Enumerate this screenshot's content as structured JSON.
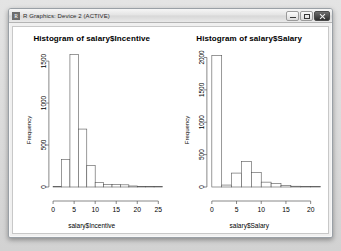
{
  "window": {
    "title": "R Graphics: Device 2 (ACTIVE)",
    "app_icon": "r-logo-icon",
    "controls": {
      "minimize_label": "",
      "maximize_label": "",
      "close_label": ""
    }
  },
  "chart_data": [
    {
      "type": "bar",
      "subtype": "histogram",
      "title": "Histogram of salary$Incentive",
      "xlabel": "salary$Incentive",
      "ylabel": "Frequency",
      "xlim": [
        -1,
        26
      ],
      "ylim": [
        0,
        1620
      ],
      "xticks": [
        0,
        5,
        10,
        15,
        20,
        25
      ],
      "yticks": [
        0,
        500,
        1000,
        1500
      ],
      "grid": false,
      "legend": false,
      "binwidth": 2,
      "bin_starts": [
        0,
        2,
        4,
        6,
        8,
        10,
        12,
        14,
        16,
        18,
        20,
        22,
        24
      ],
      "categories": [
        "0-2",
        "2-4",
        "4-6",
        "6-8",
        "8-10",
        "10-12",
        "12-14",
        "14-16",
        "16-18",
        "18-20",
        "20-22",
        "22-24",
        "24-26"
      ],
      "values": [
        8,
        330,
        1580,
        690,
        255,
        55,
        32,
        28,
        26,
        12,
        8,
        4,
        3
      ]
    },
    {
      "type": "bar",
      "subtype": "histogram",
      "title": "Histogram of salary$Salary",
      "xlabel": "salary$Salary",
      "ylabel": "Frequency",
      "xlim": [
        -1,
        22
      ],
      "ylim": [
        0,
        2100
      ],
      "xticks": [
        0,
        5,
        10,
        15,
        20
      ],
      "yticks": [
        0,
        500,
        1000,
        1500,
        2000
      ],
      "grid": false,
      "legend": false,
      "binwidth": 2,
      "bin_starts": [
        0,
        2,
        4,
        6,
        8,
        10,
        12,
        14,
        16,
        18,
        20
      ],
      "categories": [
        "0-2",
        "2-4",
        "4-6",
        "6-8",
        "8-10",
        "10-12",
        "12-14",
        "14-16",
        "16-18",
        "18-20",
        "20-22"
      ],
      "values": [
        2030,
        30,
        215,
        395,
        225,
        75,
        55,
        22,
        12,
        6,
        4
      ]
    }
  ]
}
